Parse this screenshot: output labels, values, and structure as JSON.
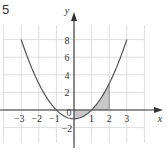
{
  "problem_number": "5",
  "chart_data": {
    "type": "line",
    "title": "",
    "function": "y = x^2 - 1",
    "xlabel": "x",
    "ylabel": "y",
    "xlim": [
      -4,
      4
    ],
    "ylim": [
      -4,
      10
    ],
    "x_ticks": [
      "-3",
      "-2",
      "-1",
      "1",
      "2",
      "3"
    ],
    "y_ticks": [
      "8",
      "6",
      "4",
      "2",
      "0",
      "-2"
    ],
    "grid": true,
    "series": [
      {
        "name": "parabola",
        "x": [
          -3,
          -2,
          -1,
          0,
          1,
          2,
          3
        ],
        "values": [
          8,
          3,
          0,
          -1,
          0,
          3,
          8
        ]
      }
    ],
    "shaded_region": {
      "x_from": 0,
      "x_to": 2,
      "between": "curve and x-axis"
    },
    "colors": {
      "curve": "#555555",
      "shade": "#c8c8c8",
      "grid": "#d6d6d6",
      "axis": "#333333"
    }
  }
}
